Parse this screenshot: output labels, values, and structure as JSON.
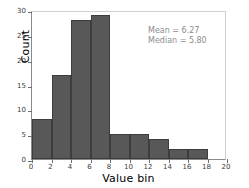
{
  "chart_data": {
    "type": "bar",
    "title": "",
    "xlabel": "Value bin",
    "ylabel": "Count",
    "xlim": [
      0,
      20
    ],
    "ylim": [
      0,
      30
    ],
    "grid": false,
    "legend": null,
    "bin_width": 2,
    "bin_edges": [
      0,
      2,
      4,
      6,
      8,
      10,
      12,
      14,
      16,
      18
    ],
    "categories": [
      "0-2",
      "2-4",
      "4-6",
      "6-8",
      "8-10",
      "10-12",
      "12-14",
      "14-16",
      "16-18"
    ],
    "values": [
      8,
      17,
      28,
      29,
      5,
      5,
      4,
      2,
      2
    ],
    "xticks": [
      0,
      2,
      4,
      6,
      8,
      10,
      12,
      14,
      16,
      18,
      20
    ],
    "yticks": [
      0,
      5,
      10,
      15,
      20,
      25,
      30
    ],
    "bar_color": "#585858",
    "bar_edge_color": "#3d3d3d",
    "annotations": [
      "Mean = 6.27",
      "Median = 5.80"
    ]
  },
  "annotation": {
    "mean_text": "Mean = 6.27",
    "median_text": "Median = 5.80",
    "color": "#8c8c8c"
  },
  "axes": {
    "x_title": "Value bin",
    "y_title": "Count"
  }
}
